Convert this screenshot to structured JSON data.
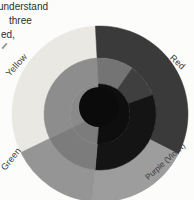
{
  "page": {
    "background": "#fcfcfb"
  },
  "text_block": {
    "line1": "understand",
    "line2": "three",
    "line3": "ed,"
  },
  "wheel": {
    "center": {
      "x": 100,
      "y": 114
    },
    "rings": {
      "outer_radii": [
        56,
        88
      ],
      "middle_radii": [
        30,
        56
      ],
      "inner_radii": [
        0,
        30
      ]
    },
    "labels": [
      {
        "id": "yellow",
        "text": "Yellow",
        "left": 3,
        "top": 60,
        "rotate": -48
      },
      {
        "id": "red",
        "text": "Red",
        "left": 169,
        "top": 57,
        "rotate": 42
      },
      {
        "id": "green",
        "text": "Green",
        "left": -2,
        "top": 154,
        "rotate": -52
      },
      {
        "id": "purple",
        "text": "Purple (Violet)",
        "left": 140,
        "top": 157,
        "rotate": -42
      }
    ],
    "segments": [
      {
        "name": "outer-yellow",
        "r1": 56,
        "r2": 88,
        "a1": 93,
        "a2": 206,
        "color": "#e9e8e3"
      },
      {
        "name": "outer-red",
        "r1": 56,
        "r2": 88,
        "a1": -27,
        "a2": 93,
        "color": "#3a3a3a"
      },
      {
        "name": "outer-purple",
        "r1": 56,
        "r2": 88,
        "a1": -95,
        "a2": -27,
        "color": "#9d9d9d"
      },
      {
        "name": "outer-green",
        "r1": 56,
        "r2": 88,
        "a1": 206,
        "a2": 265,
        "color": "#959595"
      },
      {
        "name": "middle-yellow-shade",
        "r1": 30,
        "r2": 56,
        "a1": 93,
        "a2": 206,
        "color": "#8d8d8d"
      },
      {
        "name": "middle-orange-shade",
        "r1": 30,
        "r2": 56,
        "a1": 55,
        "a2": 93,
        "color": "#747474"
      },
      {
        "name": "middle-red-shade",
        "r1": 30,
        "r2": 56,
        "a1": 20,
        "a2": 55,
        "color": "#3f3f3f"
      },
      {
        "name": "middle-violet-shade",
        "r1": 30,
        "r2": 56,
        "a1": -95,
        "a2": 20,
        "color": "#141414"
      },
      {
        "name": "middle-green-shade",
        "r1": 30,
        "r2": 56,
        "a1": 206,
        "a2": 265,
        "color": "#7c7c7c"
      },
      {
        "name": "inner-northwest",
        "r1": 0,
        "r2": 30,
        "a1": 93,
        "a2": 206,
        "color": "#8a8a8a"
      },
      {
        "name": "inner-southwest",
        "r1": 0,
        "r2": 30,
        "a1": 206,
        "a2": 265,
        "color": "#7c7c7c"
      },
      {
        "name": "inner-dark",
        "r1": 0,
        "r2": 30,
        "a1": -95,
        "a2": 93,
        "color": "#0e0e0e"
      }
    ],
    "core": {
      "cx": 99,
      "cy": 107,
      "r": 20,
      "color": "#0b0b0b"
    }
  }
}
